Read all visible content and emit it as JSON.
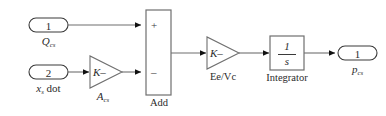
{
  "diagram": {
    "colors": {
      "stroke": "#6f6f6f",
      "stroke_dark": "#3a3a3a",
      "arrow": "#111111",
      "fill": "#ffffff",
      "text": "#2b2b2b",
      "background": "#ffffff"
    },
    "inputs": [
      {
        "id": "in1",
        "port_number": "1",
        "label_base": "Q",
        "label_sub": "cs",
        "label_tail": ""
      },
      {
        "id": "in2",
        "port_number": "2",
        "label_base": "x",
        "label_sub": "s",
        "label_tail": " dot"
      }
    ],
    "gains": [
      {
        "id": "gain-acs",
        "body": "K–",
        "label_base": "A",
        "label_sub": "cs",
        "label_tail": ""
      },
      {
        "id": "gain-ee-vc",
        "body": "K–",
        "label_base": "Ee/Vc",
        "label_sub": "",
        "label_tail": ""
      }
    ],
    "sum_block": {
      "id": "add",
      "label": "Add",
      "sign_top": "+",
      "sign_bottom": "–"
    },
    "integrator": {
      "id": "integrator",
      "numerator": "1",
      "denominator": "s",
      "label": "Integrator"
    },
    "outputs": [
      {
        "id": "out1",
        "port_number": "1",
        "label_base": "p",
        "label_sub": "cs",
        "label_tail": ""
      }
    ]
  }
}
